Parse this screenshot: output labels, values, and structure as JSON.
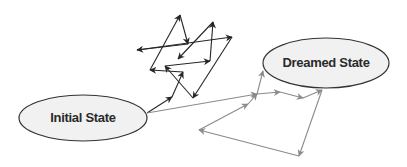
{
  "diagram": {
    "states": {
      "initial": {
        "label": "Initial State",
        "cx": 83,
        "cy": 118,
        "rx": 64,
        "ry": 23
      },
      "dreamed": {
        "label": "Dreamed State",
        "cx": 326,
        "cy": 63,
        "rx": 63,
        "ry": 25
      }
    },
    "colors": {
      "ellipse_fill": "#f1f1f1",
      "ellipse_stroke": "#333333",
      "chaotic_path": "#262626",
      "guided_path": "#8a8a8a",
      "label": "#2a2a2a"
    },
    "chaotic_path": {
      "description": "tangled black arrows wandering above the initial state",
      "points": [
        [
          147,
          113
        ],
        [
          172,
          97
        ],
        [
          183,
          72
        ],
        [
          150,
          70
        ],
        [
          180,
          15
        ],
        [
          188,
          44
        ],
        [
          137,
          50
        ],
        [
          232,
          37
        ],
        [
          193,
          98
        ],
        [
          165,
          66
        ],
        [
          210,
          61
        ],
        [
          213,
          22
        ],
        [
          178,
          59
        ]
      ]
    },
    "guided_path": {
      "description": "gray arrows progressing from initial state to dreamed state",
      "main": [
        [
          147,
          113
        ],
        [
          257,
          94
        ],
        [
          280,
          92
        ],
        [
          303,
          98
        ],
        [
          322,
          90
        ]
      ],
      "branch": [
        [
          257,
          94
        ],
        [
          263,
          71
        ]
      ],
      "loop": [
        [
          322,
          90
        ],
        [
          299,
          156
        ],
        [
          199,
          130
        ],
        [
          248,
          104
        ],
        [
          257,
          94
        ]
      ]
    }
  }
}
